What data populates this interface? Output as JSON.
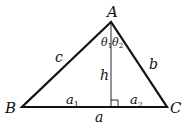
{
  "diagram": {
    "type": "triangle-with-altitude",
    "vertices": {
      "A": {
        "label": "A",
        "x": 111,
        "y": 22
      },
      "B": {
        "label": "B",
        "x": 22,
        "y": 107
      },
      "C": {
        "label": "C",
        "x": 167,
        "y": 107
      }
    },
    "foot": {
      "x": 111,
      "y": 107
    },
    "labels": {
      "side_c": "c",
      "side_b": "b",
      "side_a": "a",
      "altitude": "h",
      "segment_a1": "a",
      "segment_a1_sub": "1",
      "segment_a2": "a",
      "segment_a2_sub": "2",
      "angle_1": "θ",
      "angle_1_sub": "1",
      "angle_2": "θ",
      "angle_2_sub": "2",
      "vertex_A": "A",
      "vertex_B": "B",
      "vertex_C": "C"
    },
    "colors": {
      "stroke": "#111111",
      "background": "#ffffff"
    }
  }
}
